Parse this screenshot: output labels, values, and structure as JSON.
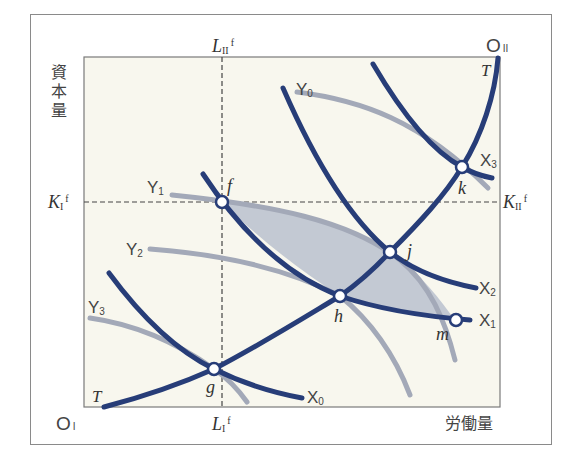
{
  "figure": {
    "y_axis_label": "資本量",
    "x_axis_label": "労働量",
    "origin_I": {
      "main": "O",
      "sub": "I"
    },
    "origin_II": {
      "main": "O",
      "sub": "II"
    },
    "L_II_f": {
      "main": "L",
      "sub": "II",
      "sup": "f"
    },
    "L_I_f": {
      "main": "L",
      "sub": "I",
      "sup": "f"
    },
    "K_I_f": {
      "main": "K",
      "sub": "I",
      "sup": "f"
    },
    "K_II_f": {
      "main": "K",
      "sub": "II",
      "sup": "f"
    },
    "contract_curve_label": "T",
    "contract_curve_label_top": "T",
    "isoquants_X": [
      {
        "main": "X",
        "sub": "0"
      },
      {
        "main": "X",
        "sub": "1"
      },
      {
        "main": "X",
        "sub": "2"
      },
      {
        "main": "X",
        "sub": "3"
      }
    ],
    "isoquants_Y": [
      {
        "main": "Y",
        "sub": "0"
      },
      {
        "main": "Y",
        "sub": "1"
      },
      {
        "main": "Y",
        "sub": "2"
      },
      {
        "main": "Y",
        "sub": "3"
      }
    ],
    "points": [
      "f",
      "g",
      "h",
      "j",
      "k",
      "m"
    ]
  },
  "colors": {
    "plot_background": "#f8f7ee",
    "x_isoquant": "#273d78",
    "y_isoquant": "#a3a9b8",
    "shaded_lens": "#bcc3cf",
    "dashed_line": "#444444",
    "frame": "#8a8a8a"
  }
}
